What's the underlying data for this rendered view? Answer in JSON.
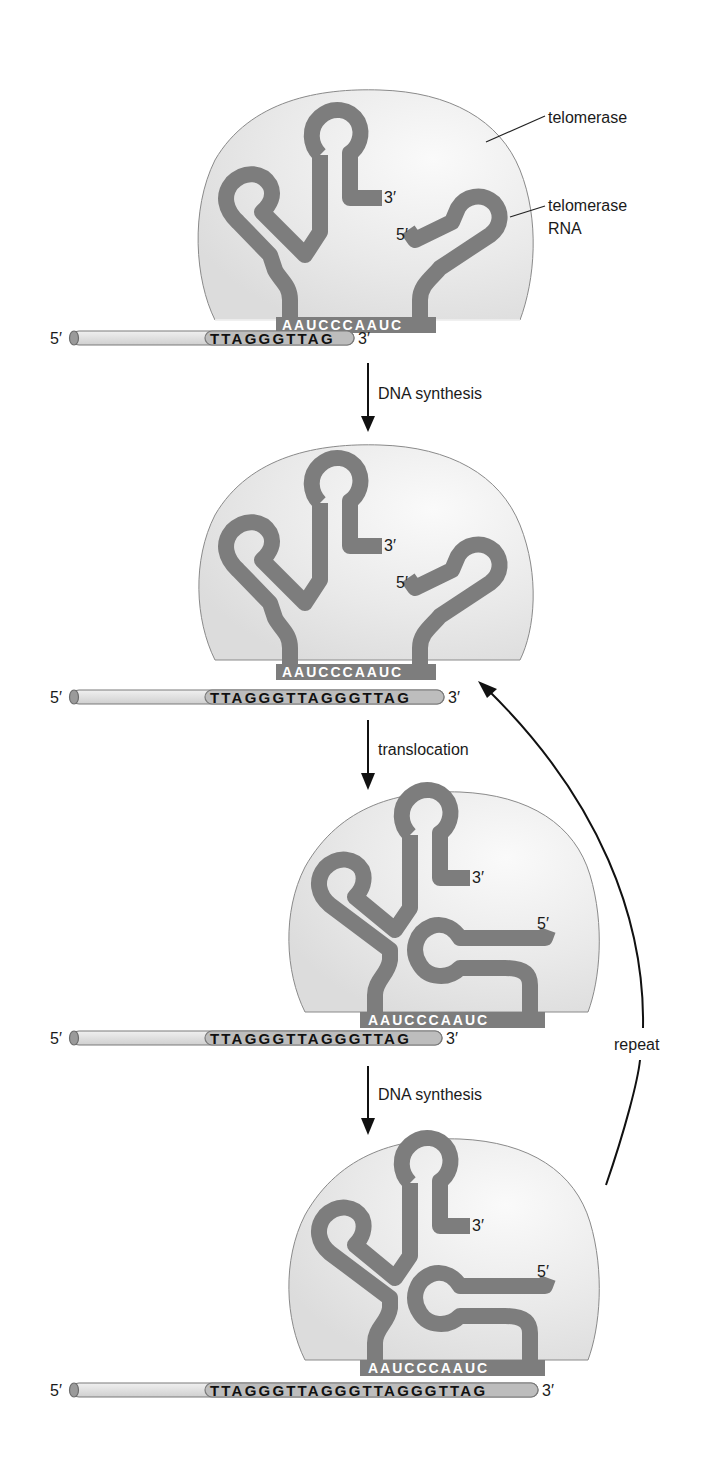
{
  "figure": {
    "labels": {
      "telomerase": "telomerase",
      "telomerase_rna_line1": "telomerase",
      "telomerase_rna_line2": "RNA"
    },
    "rna_template": "AAUCCCAAUC",
    "end_labels": {
      "five_prime": "5′",
      "three_prime": "3′"
    },
    "steps": [
      {
        "label": "DNA synthesis"
      },
      {
        "label": "translocation"
      },
      {
        "label": "DNA synthesis"
      }
    ],
    "repeat_label": "repeat",
    "panels": [
      {
        "dna_sequence": "TTAGGGTTAG"
      },
      {
        "dna_sequence": "TTAGGGTTAGGGTTAG"
      },
      {
        "dna_sequence": "TTAGGGTTAGGGTTAG"
      },
      {
        "dna_sequence": "TTAGGGTTAGGGTTAGGGTTAG"
      }
    ]
  },
  "colors": {
    "rna_strand": "#7d7d7d",
    "enzyme_fill": "#e6e6e6",
    "dna_fill": "#e3e3e3",
    "dna_sequence_fill": "#bdbdbd"
  }
}
